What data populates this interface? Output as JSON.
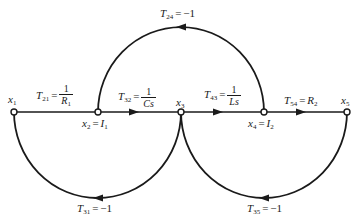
{
  "diagram": {
    "type": "signal-flow-graph",
    "colors": {
      "line": "#1a1a1a",
      "node_fill": "#ffffff",
      "background": "#ffffff"
    },
    "nodes": [
      {
        "id": "x1",
        "label": "x",
        "sub": "1",
        "x": 14,
        "y": 112
      },
      {
        "id": "x2",
        "label": "x",
        "sub": "2",
        "eq_rhs": "I",
        "eq_rhs_sub": "1",
        "x": 98,
        "y": 112
      },
      {
        "id": "x3",
        "label": "x",
        "sub": "3",
        "x": 181,
        "y": 112
      },
      {
        "id": "x4",
        "label": "x",
        "sub": "4",
        "eq_rhs": "I",
        "eq_rhs_sub": "2",
        "x": 264,
        "y": 112
      },
      {
        "id": "x5",
        "label": "x",
        "sub": "5",
        "x": 347,
        "y": 112
      }
    ],
    "edges": [
      {
        "from": "x1",
        "to": "x2",
        "name": "T",
        "sub": "21",
        "gain_num": "1",
        "gain_den": "R",
        "gain_den_sub": "1"
      },
      {
        "from": "x2",
        "to": "x3",
        "name": "T",
        "sub": "32",
        "gain_num": "1",
        "gain_den": "Cs"
      },
      {
        "from": "x3",
        "to": "x4",
        "name": "T",
        "sub": "43",
        "gain_num": "1",
        "gain_den": "Ls"
      },
      {
        "from": "x4",
        "to": "x5",
        "name": "T",
        "sub": "54",
        "gain": "R",
        "gain_sub": "2"
      },
      {
        "from": "x4",
        "to": "x2",
        "name": "T",
        "sub": "24",
        "gain": "−1"
      },
      {
        "from": "x3",
        "to": "x1",
        "name": "T",
        "sub": "31",
        "gain": "−1"
      },
      {
        "from": "x5",
        "to": "x3",
        "name": "T",
        "sub": "35",
        "gain": "−1"
      }
    ],
    "text": {
      "eq": "=",
      "x": "x",
      "T": "T",
      "I": "I",
      "R": "R",
      "s1": "1",
      "s2": "2",
      "s3": "3",
      "s4": "4",
      "s5": "5",
      "t21": "21",
      "t32": "32",
      "t43": "43",
      "t54": "54",
      "t24": "24",
      "t31": "31",
      "t35": "35",
      "one": "1",
      "Cs": "Cs",
      "Ls": "Ls",
      "neg1": "−1"
    }
  }
}
